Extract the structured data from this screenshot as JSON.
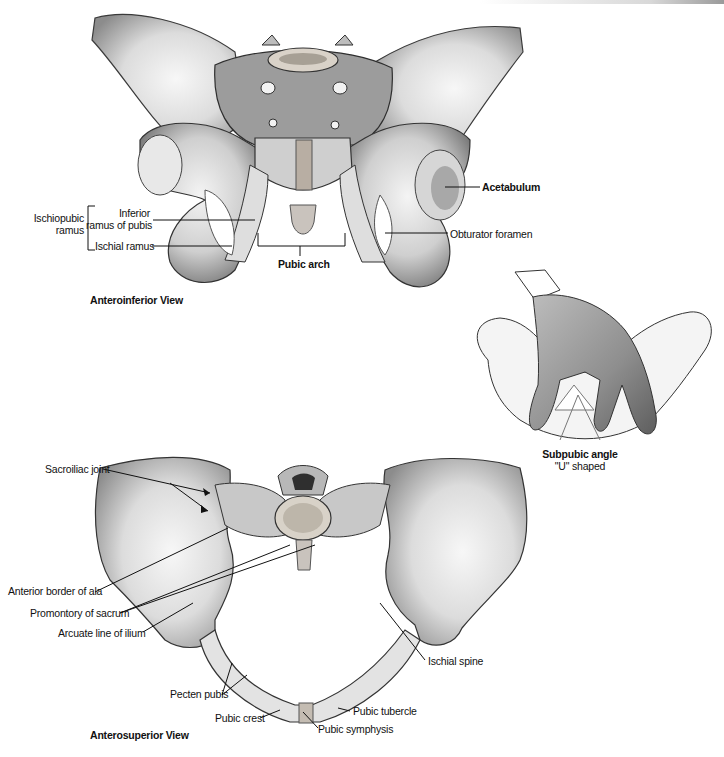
{
  "figure": {
    "views": [
      {
        "title": "Anteroinferior View",
        "labels": {
          "ischiopubic_ramus": "Ischiopubic ramus",
          "ischiopubic_line1": "Ischiopubic",
          "ischiopubic_line2": "ramus",
          "inferior_ramus_line1": "Inferior",
          "inferior_ramus_line2": "ramus of pubis",
          "ischial_ramus": "Ischial ramus",
          "pubic_arch": "Pubic arch",
          "acetabulum": "Acetabulum",
          "obturator_foramen": "Obturator foramen"
        }
      },
      {
        "title": "Subpubic angle inset",
        "labels": {
          "subpubic_angle": "Subpubic angle",
          "shape": "\"U\" shaped"
        }
      },
      {
        "title": "Anterosuperior View",
        "labels": {
          "sacroiliac_joint": "Sacroiliac joint",
          "anterior_border_ala": "Anterior border of ala",
          "promontory_sacrum": "Promontory of sacrum",
          "arcuate_line": "Arcuate line of ilium",
          "pecten_pubis": "Pecten pubis",
          "pubic_crest": "Pubic crest",
          "pubic_symphysis": "Pubic symphysis",
          "pubic_tubercle": "Pubic tubercle",
          "ischial_spine": "Ischial spine"
        }
      }
    ],
    "colors": {
      "bone_light": "#ececec",
      "bone_mid": "#b9b9b9",
      "bone_dark": "#4a4a4a",
      "cartilage": "#c9c3bd",
      "leader_line": "#111111"
    }
  }
}
